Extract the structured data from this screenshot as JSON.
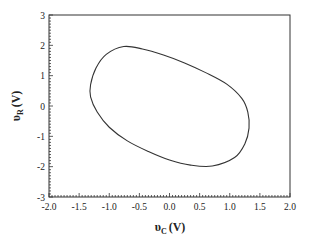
{
  "chart_data": {
    "type": "line",
    "title": "",
    "xlabel": "υC (V)",
    "ylabel": "υR (V)",
    "xlabel_main": "υ",
    "xlabel_sub": "C",
    "xlabel_unit": "(V)",
    "ylabel_main": "υ",
    "ylabel_sub": "R",
    "ylabel_unit": "(V)",
    "xlim": [
      -2.0,
      2.0
    ],
    "ylim": [
      -3,
      3
    ],
    "xticks": [
      "-2.0",
      "-1.5",
      "-1.0",
      "-0.5",
      "0.0",
      "0.5",
      "1.0",
      "1.5",
      "2.0"
    ],
    "yticks": [
      "3",
      "2",
      "1",
      "0",
      "-1",
      "-2",
      "-3"
    ],
    "grid": false,
    "legend": null,
    "series": [
      {
        "name": "limit cycle",
        "closed": true,
        "color": "#333333",
        "points": [
          [
            -0.76,
            1.96
          ],
          [
            -0.45,
            1.88
          ],
          [
            -0.1,
            1.68
          ],
          [
            0.25,
            1.42
          ],
          [
            0.6,
            1.1
          ],
          [
            0.95,
            0.72
          ],
          [
            1.2,
            0.25
          ],
          [
            1.3,
            -0.2
          ],
          [
            1.32,
            -0.73
          ],
          [
            1.25,
            -1.25
          ],
          [
            1.08,
            -1.7
          ],
          [
            0.71,
            -1.98
          ],
          [
            0.35,
            -1.95
          ],
          [
            0.0,
            -1.78
          ],
          [
            -0.35,
            -1.5
          ],
          [
            -0.7,
            -1.15
          ],
          [
            -1.0,
            -0.7
          ],
          [
            -1.2,
            -0.2
          ],
          [
            -1.31,
            0.3
          ],
          [
            -1.31,
            0.7
          ],
          [
            -1.22,
            1.25
          ],
          [
            -1.05,
            1.7
          ],
          [
            -0.76,
            1.96
          ]
        ]
      }
    ],
    "colors": {
      "axis": "#333333",
      "curve": "#333333",
      "background": "#ffffff"
    }
  }
}
